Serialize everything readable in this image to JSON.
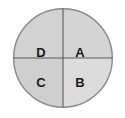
{
  "diagram": {
    "type": "quadrant-circle",
    "shape": "circle",
    "divider_count": 2,
    "colors": {
      "background": "#ffffff",
      "outline": "#8c8c8c",
      "divider": "#5a5a5a",
      "label_text": "#1a1a1a",
      "fill_top_left": "#d2d2d2",
      "fill_top_right": "#d4d4d4",
      "fill_bottom_left": "#cfcfcf",
      "fill_bottom_right": "#dcdcdc"
    },
    "quadrants": [
      {
        "id": "top-left",
        "label": "D"
      },
      {
        "id": "top-right",
        "label": "A"
      },
      {
        "id": "bottom-left",
        "label": "C"
      },
      {
        "id": "bottom-right",
        "label": "B"
      }
    ]
  }
}
